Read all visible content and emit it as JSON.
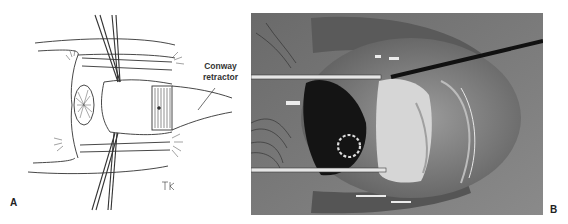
{
  "figure": {
    "panels": [
      {
        "letter": "A",
        "kind": "line illustration",
        "callout": {
          "line1": "Conway",
          "line2": "retractor"
        },
        "signature": "TH"
      },
      {
        "letter": "B",
        "kind": "grayscale surgical photograph"
      }
    ]
  },
  "colors": {
    "ink": "#333333",
    "photo_dark": "#1a1a1a",
    "photo_mid": "#7a7a7a",
    "photo_light": "#d8d8d8"
  }
}
